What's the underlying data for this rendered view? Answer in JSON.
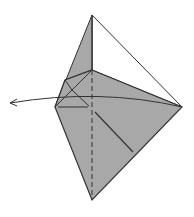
{
  "diagram": {
    "type": "origami-fold-step",
    "colors": {
      "paper_fill": "#a8a8a8",
      "line": "#333333",
      "background": "#ffffff"
    },
    "elements": [
      "folded paper model (kite shape)",
      "white unfolded top-right triangle",
      "vertical dashed valley-fold line",
      "curved arrow pointing left"
    ]
  }
}
